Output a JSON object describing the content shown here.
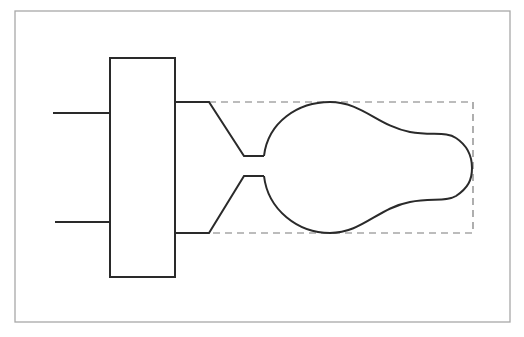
{
  "diagram": {
    "description": "Line drawing of a rectangular block with two input leads on the left and two output leads on the right that funnel into a narrow neck, opening into a bulb-shaped (pear/light-bulb) outline enclosed by a dashed bounding rectangle.",
    "colors": {
      "background": "#ffffff",
      "frame": "#a8a8a8",
      "stroke": "#2a2a2a",
      "dashed": "#7a7a7a"
    },
    "frame": {
      "x": 15,
      "y": 11,
      "width": 495,
      "height": 311
    },
    "block": {
      "x": 110,
      "y": 58,
      "width": 65,
      "height": 219
    },
    "input_leads": [
      {
        "name": "upper",
        "x1": 53,
        "x2": 110,
        "y": 113
      },
      {
        "name": "lower",
        "x1": 55,
        "x2": 110,
        "y": 222
      }
    ],
    "output_leads": [
      {
        "name": "upper",
        "x1": 175,
        "x2": 209,
        "y": 102
      },
      {
        "name": "lower",
        "x1": 175,
        "x2": 209,
        "y": 233
      }
    ],
    "neck": {
      "x1": 244,
      "x2": 264,
      "y_top": 156,
      "y_bottom": 176
    },
    "bulb": {
      "peak_top": [
        330,
        102
      ],
      "peak_bottom": [
        330,
        233
      ],
      "tip": [
        472,
        168
      ]
    },
    "dashed_bounds": {
      "x": 209,
      "y": 102,
      "width": 264,
      "height": 131
    }
  }
}
